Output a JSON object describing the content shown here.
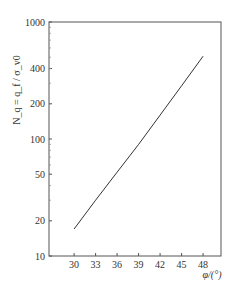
{
  "chart_data": {
    "type": "line",
    "title": "",
    "xlabel": "φ/(°)",
    "ylabel": "N_q = q_f / σ_v0",
    "x_ticks": [
      30,
      33,
      36,
      39,
      42,
      45,
      48
    ],
    "y_ticks": [
      10,
      20,
      50,
      100,
      200,
      400,
      1000
    ],
    "y_scale": "log",
    "xlim": [
      26.5,
      50.5
    ],
    "ylim": [
      10,
      1000
    ],
    "grid": false,
    "legend": null,
    "series": [
      {
        "name": "N_q",
        "x": [
          30,
          33,
          36,
          39,
          42,
          45,
          48
        ],
        "values": [
          17,
          30,
          52,
          90,
          160,
          285,
          510
        ]
      }
    ]
  }
}
